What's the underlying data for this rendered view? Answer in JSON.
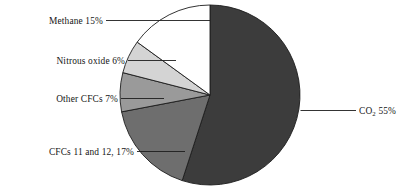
{
  "chart_data": {
    "type": "pie",
    "title": "",
    "subtitle": "",
    "xlabel": "",
    "ylabel": "",
    "legend_position": "none",
    "grid": false,
    "units": "percent",
    "start_angle_deg": 0,
    "direction": "clockwise",
    "categories": [
      "CO2 55%",
      "CFCs 11 and 12, 17%",
      "Other CFCs 7%",
      "Nitrous oxide 6%",
      "Methane 15%"
    ],
    "values": [
      55,
      17,
      7,
      6,
      15
    ],
    "slices": [
      {
        "name": "CO2",
        "label": "CO",
        "label_sub": "2",
        "label_tail": " 55%",
        "value": 55,
        "color": "#3c3c3c",
        "label_side": "right"
      },
      {
        "name": "CFCs 11 and 12",
        "label": "CFCs 11 and 12, 17%",
        "value": 17,
        "color": "#6e6e6e",
        "label_side": "left"
      },
      {
        "name": "Other CFCs",
        "label": "Other CFCs 7%",
        "value": 7,
        "color": "#9a9a9a",
        "label_side": "left"
      },
      {
        "name": "Nitrous oxide",
        "label": "Nitrous oxide 6%",
        "value": 6,
        "color": "#d4d4d4",
        "label_side": "left"
      },
      {
        "name": "Methane",
        "label": "Methane 15%",
        "value": 15,
        "color": "#ffffff",
        "label_side": "left"
      }
    ],
    "outline_color": "#1d1d1d",
    "background_color": "#ffffff"
  }
}
